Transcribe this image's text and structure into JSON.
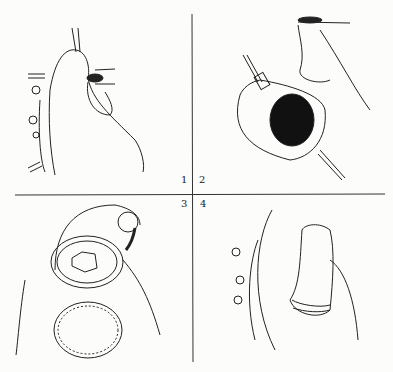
{
  "figure": {
    "type": "surgical illustration, 4-panel sequence",
    "panels": [
      {
        "number": "1",
        "description": "Heart with aortic cannula, clamped vessels on left side and atrial incision area"
      },
      {
        "number": "2",
        "description": "Opened chamber retracted with two forceps showing dark cavity"
      },
      {
        "number": "3",
        "description": "Valve exposed within ring with patch (cross-hatched) below, sutures"
      },
      {
        "number": "4",
        "description": "Sutured tubular conduit/graft with ribbed base attached to heart"
      }
    ]
  }
}
